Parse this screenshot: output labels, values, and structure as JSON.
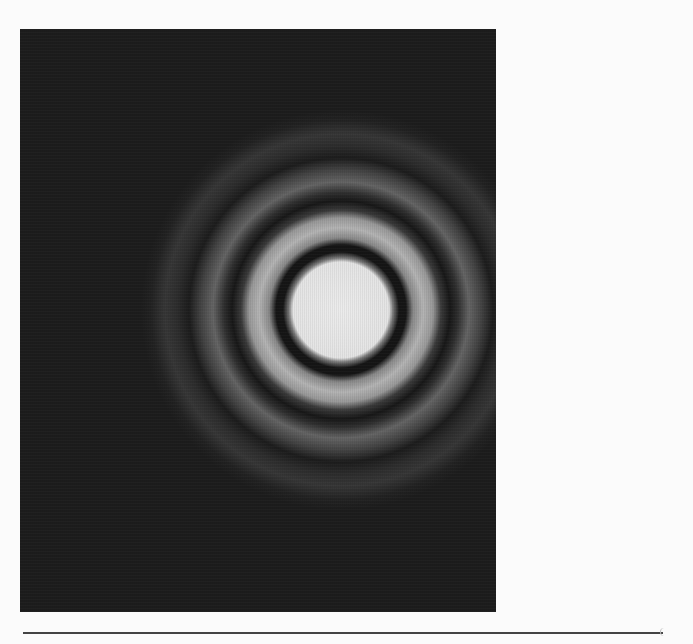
{
  "figure": {
    "background_color": "#1c1c1c",
    "page_color": "#fbfbfb",
    "center": {
      "x": 321,
      "y": 281
    },
    "rings": [
      {
        "type": "central-disc",
        "outer_radius": 52,
        "color": "#e6e6e6"
      },
      {
        "type": "dark",
        "outer_radius": 65,
        "color": "#141414"
      },
      {
        "type": "bright",
        "outer_radius": 97,
        "color": "#a8a8a8"
      },
      {
        "type": "dark",
        "outer_radius": 115,
        "color": "#161616"
      },
      {
        "type": "bright",
        "outer_radius": 140,
        "color": "#5a5a5a"
      },
      {
        "type": "dark",
        "outer_radius": 157,
        "color": "#1a1a1a"
      },
      {
        "type": "bright",
        "outer_radius": 180,
        "color": "#333333"
      }
    ]
  }
}
